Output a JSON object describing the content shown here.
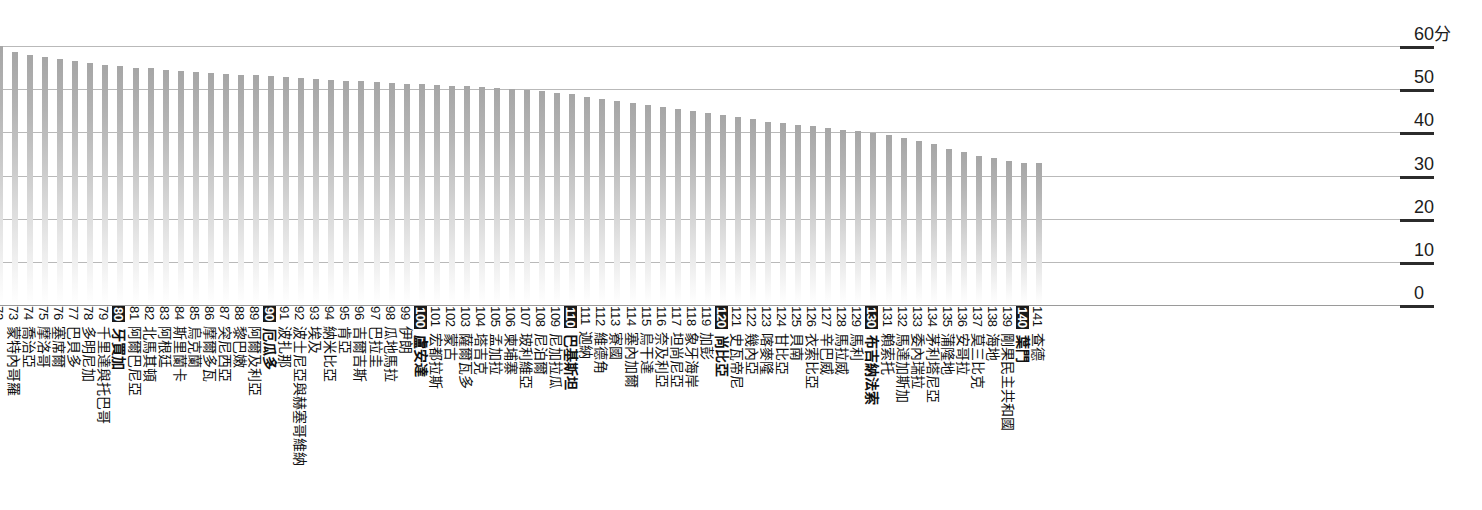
{
  "axis": {
    "unit_suffix": "分",
    "ticks": [
      {
        "value": 60,
        "label": "60",
        "unit": "分"
      },
      {
        "value": 50,
        "label": "50",
        "unit": ""
      },
      {
        "value": 40,
        "label": "40",
        "unit": ""
      },
      {
        "value": 30,
        "label": "30",
        "unit": ""
      },
      {
        "value": 20,
        "label": "20",
        "unit": ""
      },
      {
        "value": 10,
        "label": "10",
        "unit": ""
      },
      {
        "value": 0,
        "label": "0",
        "unit": ""
      }
    ]
  },
  "style": {
    "bar_top_color": "#a6a6a6",
    "bar_bottom_color": "#ffffff",
    "gridline_color": "#b9b9b9",
    "tick_color": "#2b2b2b",
    "text_color": "#111111",
    "highlight_bg": "#1a1a1a",
    "highlight_fg": "#ffffff"
  },
  "chart_data": {
    "type": "bar",
    "title": "",
    "xlabel": "",
    "ylabel": "分",
    "ylim": [
      0,
      60
    ],
    "grid": true,
    "legend": "none",
    "orientation": "vertical",
    "note": "Ranked score list, ranks 72-141; rank 72 bar is clipped at the left edge of the frame.",
    "categories": [
      "",
      "蒙特內哥羅",
      "喬治亞",
      "摩洛哥",
      "塞席爾",
      "巴貝多",
      "多明尼加",
      "千里達與托巴哥",
      "牙買加",
      "阿爾巴尼亞",
      "北馬其頓",
      "阿根廷",
      "斯里蘭卡",
      "烏克蘭",
      "摩爾多瓦",
      "突尼西亞",
      "黎巴嫩",
      "阿爾及利亞",
      "厄瓜多",
      "波扎那",
      "波士尼亞與赫塞哥維納",
      "埃及",
      "納米比亞",
      "肯亞",
      "吉爾吉斯",
      "巴拉圭",
      "瓜地馬拉",
      "伊朗",
      "盧安達",
      "宏都拉斯",
      "蒙古",
      "薩爾瓦多",
      "塔吉克",
      "孟加拉",
      "柬埔寨",
      "玻利維亞",
      "尼泊爾",
      "尼加拉瓜",
      "巴基斯坦",
      "迦納",
      "維德角",
      "寮國",
      "塞內加爾",
      "烏干達",
      "奈及利亞",
      "坦尚尼亞",
      "象牙海岸",
      "加彭",
      "尚比亞",
      "史瓦帝尼",
      "幾內亞",
      "喀麥隆",
      "甘比亞",
      "貝南",
      "衣索比亞",
      "辛巴威",
      "馬拉威",
      "馬利",
      "布吉納法索",
      "賴索托",
      "馬達加斯加",
      "委內瑞拉",
      "茅利塔尼亞",
      "蒲隆地",
      "安哥拉",
      "莫三比克",
      "海地",
      "剛果民主共和國",
      "葉門",
      "查德"
    ],
    "ranks": [
      72,
      73,
      74,
      75,
      76,
      77,
      78,
      79,
      80,
      81,
      82,
      83,
      84,
      85,
      86,
      87,
      88,
      89,
      90,
      91,
      92,
      93,
      94,
      95,
      96,
      97,
      98,
      99,
      100,
      101,
      102,
      103,
      104,
      105,
      106,
      107,
      108,
      109,
      110,
      111,
      112,
      113,
      114,
      115,
      116,
      117,
      118,
      119,
      120,
      121,
      122,
      123,
      124,
      125,
      126,
      127,
      128,
      129,
      130,
      131,
      132,
      133,
      134,
      135,
      136,
      137,
      138,
      139,
      140,
      141
    ],
    "highlighted_ranks": [
      80,
      90,
      100,
      110,
      120,
      130,
      140
    ],
    "values": [
      60.0,
      58.5,
      58.0,
      57.5,
      57.0,
      56.5,
      56.0,
      55.5,
      55.3,
      55.0,
      54.8,
      54.5,
      54.3,
      54.0,
      53.8,
      53.6,
      53.4,
      53.2,
      53.0,
      52.8,
      52.6,
      52.4,
      52.2,
      52.0,
      51.8,
      51.6,
      51.5,
      51.3,
      51.2,
      51.0,
      50.8,
      50.7,
      50.5,
      50.3,
      50.0,
      49.8,
      49.5,
      49.2,
      48.8,
      48.3,
      47.8,
      47.3,
      46.8,
      46.3,
      45.8,
      45.3,
      44.9,
      44.5,
      44.0,
      43.5,
      43.0,
      42.5,
      42.2,
      41.8,
      41.4,
      41.0,
      40.6,
      40.2,
      39.8,
      39.4,
      38.8,
      38.0,
      37.3,
      36.2,
      35.5,
      34.6,
      34.0,
      33.4,
      33.0,
      32.8
    ]
  }
}
